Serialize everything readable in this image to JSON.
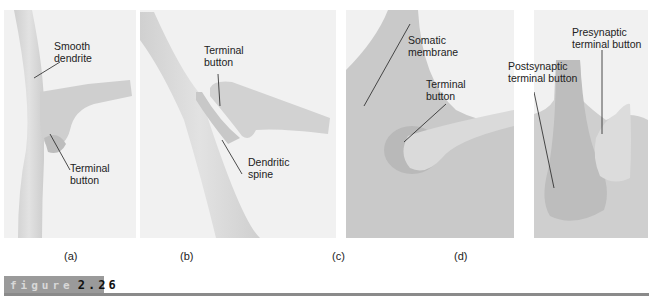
{
  "figure": {
    "word": "figure",
    "number": "2.26"
  },
  "panels": [
    {
      "id": "a",
      "caption": "(a)",
      "labels": [
        {
          "text_line1": "Smooth",
          "text_line2": "dendrite"
        },
        {
          "text_line1": "Terminal",
          "text_line2": "button"
        }
      ]
    },
    {
      "id": "b",
      "caption": "(b)",
      "labels": [
        {
          "text_line1": "Terminal",
          "text_line2": "button"
        },
        {
          "text_line1": "Dendritic",
          "text_line2": "spine"
        }
      ]
    },
    {
      "id": "c",
      "caption": "(c)",
      "labels": [
        {
          "text_line1": "Somatic",
          "text_line2": "membrane"
        },
        {
          "text_line1": "Terminal",
          "text_line2": "button"
        }
      ]
    },
    {
      "id": "d",
      "caption": "(d)",
      "labels": [
        {
          "text_line1": "Presynaptic",
          "text_line2": "terminal button"
        },
        {
          "text_line1": "Postsynaptic",
          "text_line2": "terminal button"
        }
      ]
    }
  ],
  "colors": {
    "panel_bg": "#f1f1f1",
    "tissue_light": "#dcdcdc",
    "tissue_mid": "#c9c9c9",
    "tissue_dark": "#b0b0b0",
    "figure_bar": "#9a9a9a",
    "rule": "#8a8a8a"
  }
}
